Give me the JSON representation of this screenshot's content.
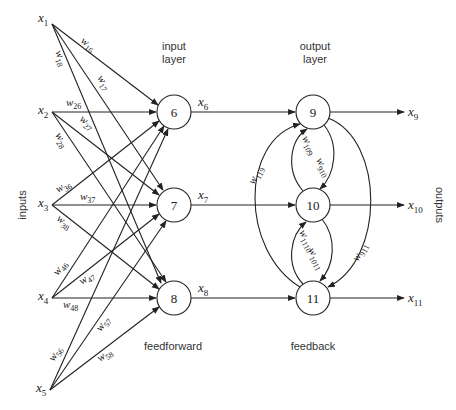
{
  "diagram": {
    "title_labels": {
      "input_layer": [
        "input",
        "layer"
      ],
      "output_layer": [
        "output",
        "layer"
      ],
      "feedforward": "feedforward",
      "feedback": "feedback",
      "inputs": "inputs",
      "outputs": "outputs"
    },
    "inputs": [
      {
        "id": "x1",
        "base": "x",
        "sub": "1",
        "x": 52,
        "y": 24
      },
      {
        "id": "x2",
        "base": "x",
        "sub": "2",
        "x": 52,
        "y": 112
      },
      {
        "id": "x3",
        "base": "x",
        "sub": "3",
        "x": 52,
        "y": 205
      },
      {
        "id": "x4",
        "base": "x",
        "sub": "4",
        "x": 52,
        "y": 298
      },
      {
        "id": "x5",
        "base": "x",
        "sub": "5",
        "x": 50,
        "y": 390
      }
    ],
    "input_layer_nodes": [
      {
        "id": "6",
        "label": "6",
        "cx": 174,
        "cy": 112,
        "out": {
          "base": "x",
          "sub": "6"
        }
      },
      {
        "id": "7",
        "label": "7",
        "cx": 174,
        "cy": 205,
        "out": {
          "base": "x",
          "sub": "7"
        }
      },
      {
        "id": "8",
        "label": "8",
        "cx": 174,
        "cy": 298,
        "out": {
          "base": "x",
          "sub": "8"
        }
      }
    ],
    "output_layer_nodes": [
      {
        "id": "9",
        "label": "9",
        "cx": 313,
        "cy": 112,
        "out": {
          "base": "x",
          "sub": "9"
        }
      },
      {
        "id": "10",
        "label": "10",
        "cx": 313,
        "cy": 205,
        "out": {
          "base": "x",
          "sub": "10"
        }
      },
      {
        "id": "11",
        "label": "11",
        "cx": 313,
        "cy": 298,
        "out": {
          "base": "x",
          "sub": "11"
        }
      }
    ],
    "node_radius": 17,
    "feedforward_weights": [
      {
        "from": "x1",
        "to": "6",
        "base": "w",
        "sub": "16"
      },
      {
        "from": "x1",
        "to": "7",
        "base": "w",
        "sub": "17"
      },
      {
        "from": "x1",
        "to": "8",
        "base": "w",
        "sub": "18"
      },
      {
        "from": "x2",
        "to": "6",
        "base": "w",
        "sub": "26"
      },
      {
        "from": "x2",
        "to": "7",
        "base": "w",
        "sub": "27"
      },
      {
        "from": "x2",
        "to": "8",
        "base": "w",
        "sub": "28"
      },
      {
        "from": "x3",
        "to": "6",
        "base": "w",
        "sub": "36"
      },
      {
        "from": "x3",
        "to": "7",
        "base": "w",
        "sub": "37"
      },
      {
        "from": "x3",
        "to": "8",
        "base": "w",
        "sub": "38"
      },
      {
        "from": "x4",
        "to": "6",
        "base": "w",
        "sub": "46"
      },
      {
        "from": "x4",
        "to": "7",
        "base": "w",
        "sub": "47"
      },
      {
        "from": "x4",
        "to": "8",
        "base": "w",
        "sub": "48"
      },
      {
        "from": "x5",
        "to": "6",
        "base": "w",
        "sub": "56"
      },
      {
        "from": "x5",
        "to": "7",
        "base": "w",
        "sub": "57"
      },
      {
        "from": "x5",
        "to": "8",
        "base": "w",
        "sub": "58"
      }
    ],
    "feedback_weights": [
      {
        "from": "11",
        "to": "9",
        "base": "w",
        "sub": "119"
      },
      {
        "from": "10",
        "to": "9",
        "base": "w",
        "sub": "109"
      },
      {
        "from": "9",
        "to": "10",
        "base": "w",
        "sub": "910"
      },
      {
        "from": "11",
        "to": "10",
        "base": "w",
        "sub": "1110"
      },
      {
        "from": "10",
        "to": "11",
        "base": "w",
        "sub": "1011"
      },
      {
        "from": "9",
        "to": "11",
        "base": "w",
        "sub": "911"
      }
    ]
  }
}
